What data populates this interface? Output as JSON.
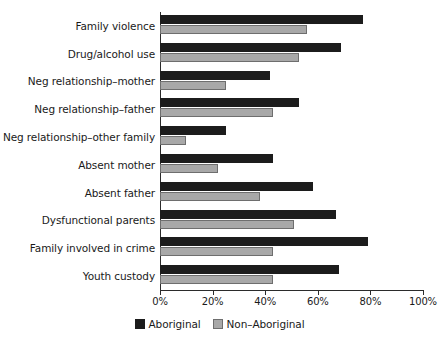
{
  "chart_data": {
    "type": "bar",
    "orientation": "horizontal",
    "title": "",
    "xlabel": "",
    "ylabel": "",
    "xlim": [
      0,
      100
    ],
    "xticks": [
      "0%",
      "20%",
      "40%",
      "60%",
      "80%",
      "100%"
    ],
    "xtick_values": [
      0,
      20,
      40,
      60,
      80,
      100
    ],
    "grid": false,
    "legend_position": "bottom-center",
    "categories": [
      "Family violence",
      "Drug/alcohol use",
      "Neg relationship–mother",
      "Neg relationship–father",
      "Neg relationship–other family",
      "Absent mother",
      "Absent father",
      "Dysfunctional parents",
      "Family involved in crime",
      "Youth custody"
    ],
    "series": [
      {
        "name": "Aboriginal",
        "color": "#1c1c1c",
        "values": [
          77,
          69,
          42,
          53,
          25,
          43,
          58,
          67,
          79,
          68
        ]
      },
      {
        "name": "Non–Aboriginal",
        "color": "#a8a8a8",
        "values": [
          56,
          53,
          25,
          43,
          10,
          22,
          38,
          51,
          43,
          43
        ]
      }
    ]
  }
}
